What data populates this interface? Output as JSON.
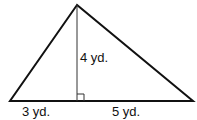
{
  "diagram": {
    "type": "triangle-with-altitude",
    "colors": {
      "stroke": "#111111",
      "altitude": "#333333",
      "background": "#ffffff"
    },
    "vertices": {
      "apex": [
        77,
        5
      ],
      "left": [
        10,
        101
      ],
      "right": [
        193,
        101
      ],
      "foot": [
        77,
        101
      ]
    },
    "labels": {
      "height": "4 yd.",
      "left_base": "3 yd.",
      "right_base": "5 yd."
    },
    "right_angle_marker": true
  }
}
